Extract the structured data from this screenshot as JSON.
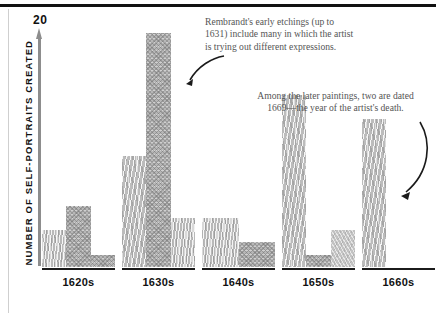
{
  "chart_data": {
    "type": "bar",
    "title": "",
    "xlabel": "",
    "ylabel": "NUMBER OF SELF-PORTRAITS CREATED",
    "ylim": [
      0,
      20
    ],
    "y_top_tick": "20",
    "grid": false,
    "legend": "none",
    "categories": [
      "1620s",
      "1630s",
      "1640s",
      "1650s",
      "1660s"
    ],
    "groups": [
      {
        "category": "1620s",
        "bars": [
          {
            "value": 3,
            "texture": "grain"
          },
          {
            "value": 5,
            "texture": "cross"
          },
          {
            "value": 1,
            "texture": "cross"
          }
        ]
      },
      {
        "category": "1630s",
        "bars": [
          {
            "value": 9,
            "texture": "wave"
          },
          {
            "value": 19,
            "texture": "cross"
          },
          {
            "value": 4,
            "texture": "grain"
          }
        ]
      },
      {
        "category": "1640s",
        "bars": [
          {
            "value": 4,
            "texture": "grain"
          },
          {
            "value": 2,
            "texture": "cross"
          }
        ]
      },
      {
        "category": "1650s",
        "bars": [
          {
            "value": 14,
            "texture": "wave"
          },
          {
            "value": 1,
            "texture": "cross"
          },
          {
            "value": 3,
            "texture": "soft"
          }
        ]
      },
      {
        "category": "1660s",
        "bars": [
          {
            "value": 12,
            "texture": "wave"
          }
        ]
      }
    ],
    "annotations": [
      {
        "id": "note-etchings",
        "text": "Rembrandt's early etchings (up to 1631) include many in which the artist is trying out different expressions.",
        "points_to": "1630s tall bar"
      },
      {
        "id": "note-paintings",
        "text": "Among the later paintings, two are dated 1669—the year of the artist's death.",
        "points_to": "1660s bar"
      }
    ]
  },
  "colors": {
    "rule": "#111111",
    "axis": "#8d8d8d",
    "bar_fill": "#b7b7b7",
    "note_text": "#555555",
    "baseline": "#1b1b1b"
  }
}
